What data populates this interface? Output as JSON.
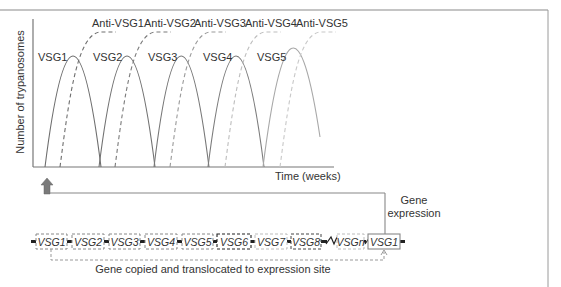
{
  "chart": {
    "y_label": "Number of trypanosomes",
    "x_label": "Time (weeks)",
    "vsg_labels": [
      "VSG1",
      "VSG2",
      "VSG3",
      "VSG4",
      "VSG5"
    ],
    "anti_labels": [
      "Anti-VSG1",
      "Anti-VSG2",
      "Anti-VSG3",
      "Anti-VSG4",
      "Anti-VSG5"
    ]
  },
  "gene_expression_label": [
    "Gene",
    "expression"
  ],
  "genome": {
    "genes": [
      {
        "label": "VSG1",
        "style": "dashed-gray"
      },
      {
        "label": "VSG2",
        "style": "dashed-gray"
      },
      {
        "label": "VSG3",
        "style": "dashed-gray"
      },
      {
        "label": "VSG4",
        "style": "dashed-gray"
      },
      {
        "label": "VSG5",
        "style": "dashed-gray"
      },
      {
        "label": "VSG6",
        "style": "dashed-dark"
      },
      {
        "label": "VSG7",
        "style": "dashed-light"
      },
      {
        "label": "VSG8",
        "style": "dashed-dark"
      },
      {
        "label": "VSGn",
        "style": "dashed-light"
      },
      {
        "label": "VSG1",
        "style": "solid-expression-site"
      }
    ],
    "copy_label": "Gene copied and translocated to expression site"
  },
  "colors": {
    "frame": "#8a8a8a",
    "axis": "#666666",
    "curve_solid": [
      "#6e6e6e",
      "#747474",
      "#7a7a7a",
      "#808080",
      "#a6a6a6"
    ],
    "curve_dashed": [
      "#6e6e6e",
      "#7c7c7c",
      "#9a9a9a",
      "#bdbdbd",
      "#c8c8c8"
    ],
    "arrow": "#7a7a7a"
  }
}
